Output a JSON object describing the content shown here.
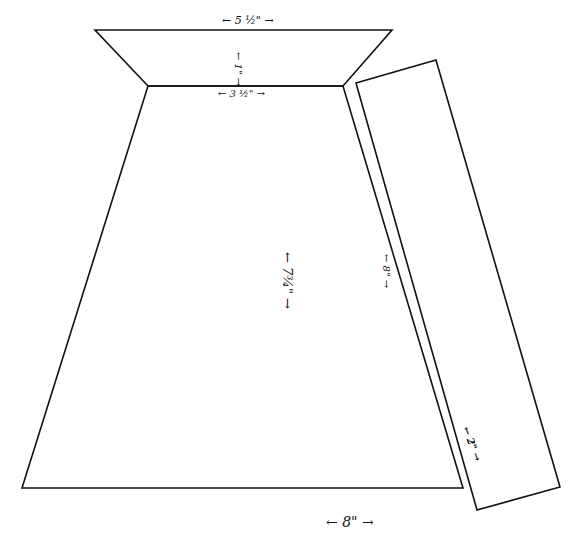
{
  "diagram": {
    "title": "",
    "pieces": [
      {
        "name": "top-trapezoid",
        "top_width": "5 1/2\"",
        "bottom_width": "3 1/2\"",
        "height": "1\""
      },
      {
        "name": "main-trapezoid",
        "bottom_width": "8\"",
        "height": "7 3/4\"",
        "side": "8\""
      },
      {
        "name": "side-strip",
        "length": "8\"",
        "width": "2\""
      }
    ],
    "labels": {
      "top_width": "← 5 ½\" →",
      "top_height": "← 1\" →",
      "middle_width": "← 3 ½\" →",
      "main_height": "← 7¾\" →",
      "side_length": "← 8\" →",
      "strip_width": "← 2\" →",
      "bottom_width": "← 8\" →"
    },
    "stroke_color": "#111111"
  }
}
